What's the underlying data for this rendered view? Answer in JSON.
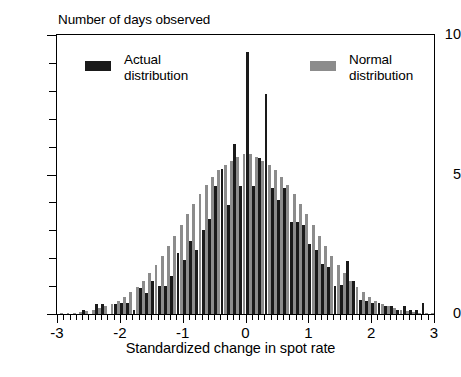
{
  "chart_data": {
    "type": "bar",
    "title": "",
    "ylabel": "Number of days observed",
    "xlabel": "Standardized change in spot rate",
    "xlim": [
      -3,
      3
    ],
    "ylim": [
      0,
      10
    ],
    "yticks": [
      0,
      1,
      2,
      3,
      4,
      5,
      6,
      7,
      8,
      9,
      10
    ],
    "ytick_labels": [
      "0",
      "",
      "",
      "",
      "",
      "5",
      "",
      "",
      "",
      "",
      "10"
    ],
    "xticks": [
      -3,
      -2,
      -1,
      0,
      1,
      2,
      3
    ],
    "xtick_labels": [
      "-3",
      "-2",
      "-1",
      "0",
      "1",
      "2",
      "3"
    ],
    "xtick_minor_step": 0.1,
    "grid": false,
    "legend_position": "inside-top",
    "bar_pair_step": 0.1,
    "x_bin_centers": [
      -2.95,
      -2.85,
      -2.75,
      -2.65,
      -2.55,
      -2.45,
      -2.35,
      -2.25,
      -2.15,
      -2.05,
      -1.95,
      -1.85,
      -1.75,
      -1.65,
      -1.55,
      -1.45,
      -1.35,
      -1.25,
      -1.15,
      -1.05,
      -0.95,
      -0.85,
      -0.75,
      -0.65,
      -0.55,
      -0.45,
      -0.35,
      -0.25,
      -0.15,
      -0.05,
      0.05,
      0.15,
      0.25,
      0.35,
      0.45,
      0.55,
      0.65,
      0.75,
      0.85,
      0.95,
      1.05,
      1.15,
      1.25,
      1.35,
      1.45,
      1.55,
      1.65,
      1.75,
      1.85,
      1.95,
      2.05,
      2.15,
      2.25,
      2.35,
      2.45,
      2.55,
      2.65,
      2.75,
      2.85,
      2.95
    ],
    "series": [
      {
        "name": "Actual distribution",
        "color": "#1a1a1a",
        "values": [
          0.0,
          0.0,
          0.0,
          0.0,
          0.15,
          0.0,
          0.35,
          0.35,
          0.0,
          0.35,
          0.4,
          0.4,
          0.15,
          0.95,
          0.75,
          1.2,
          1.0,
          1.0,
          1.35,
          2.2,
          1.95,
          2.6,
          2.3,
          3.0,
          3.4,
          4.6,
          5.2,
          3.9,
          6.1,
          4.6,
          9.4,
          4.6,
          5.6,
          7.9,
          4.5,
          4.1,
          4.5,
          3.3,
          3.3,
          3.2,
          2.5,
          2.3,
          1.8,
          1.7,
          1.0,
          1.05,
          1.9,
          1.2,
          0.5,
          0.45,
          0.4,
          0.4,
          0.3,
          0.3,
          0.15,
          0.3,
          0.15,
          0.15,
          0.4,
          0.0
        ]
      },
      {
        "name": "Normal distribution",
        "color": "#8c8c8c",
        "values": [
          0.02,
          0.03,
          0.05,
          0.07,
          0.1,
          0.14,
          0.2,
          0.27,
          0.36,
          0.47,
          0.61,
          0.78,
          0.98,
          1.2,
          1.47,
          1.76,
          2.08,
          2.43,
          2.8,
          3.18,
          3.57,
          3.95,
          4.31,
          4.63,
          4.92,
          5.16,
          5.35,
          5.5,
          5.62,
          5.72,
          5.72,
          5.62,
          5.5,
          5.35,
          5.16,
          4.92,
          4.63,
          4.31,
          3.95,
          3.57,
          3.18,
          2.8,
          2.43,
          2.08,
          1.76,
          1.47,
          1.2,
          0.98,
          0.78,
          0.61,
          0.47,
          0.36,
          0.27,
          0.2,
          0.14,
          0.1,
          0.07,
          0.05,
          0.03,
          0.02
        ]
      }
    ]
  },
  "legend": {
    "actual": {
      "line1": "Actual",
      "line2": "distribution"
    },
    "normal": {
      "line1": "Normal",
      "line2": "distribution"
    }
  }
}
